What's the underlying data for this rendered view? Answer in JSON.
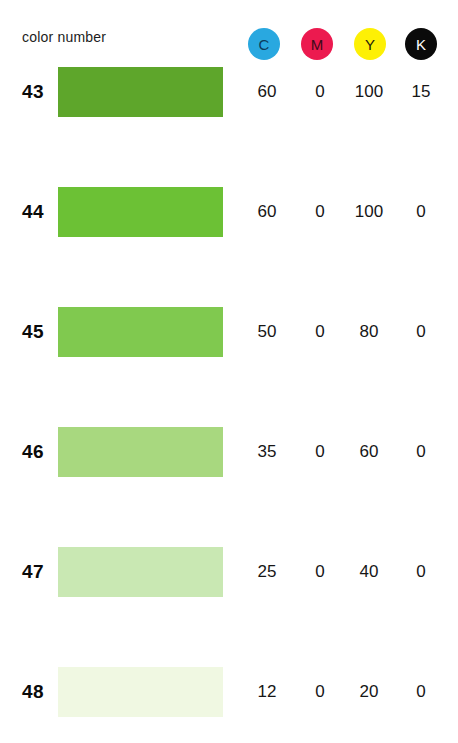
{
  "header": {
    "label": "color number",
    "channels": [
      {
        "letter": "C",
        "color": "#29a8e0",
        "text_color": "#0d3a5c"
      },
      {
        "letter": "M",
        "color": "#ec1a4f",
        "text_color": "#3c0a18"
      },
      {
        "letter": "Y",
        "color": "#fdf005",
        "text_color": "#22200a"
      },
      {
        "letter": "K",
        "color": "#0a0a0a",
        "text_color": "#ffffff"
      }
    ]
  },
  "rows": [
    {
      "number": "43",
      "swatch": "#5ea62b",
      "c": "60",
      "m": "0",
      "y": "100",
      "k": "15"
    },
    {
      "number": "44",
      "swatch": "#6cc135",
      "c": "60",
      "m": "0",
      "y": "100",
      "k": "0"
    },
    {
      "number": "45",
      "swatch": "#80c94f",
      "c": "50",
      "m": "0",
      "y": "80",
      "k": "0"
    },
    {
      "number": "46",
      "swatch": "#a8d87f",
      "c": "35",
      "m": "0",
      "y": "60",
      "k": "0"
    },
    {
      "number": "47",
      "swatch": "#c9e8b3",
      "c": "25",
      "m": "0",
      "y": "40",
      "k": "0"
    },
    {
      "number": "48",
      "swatch": "#f0f8e2",
      "c": "12",
      "m": "0",
      "y": "20",
      "k": "0"
    }
  ]
}
